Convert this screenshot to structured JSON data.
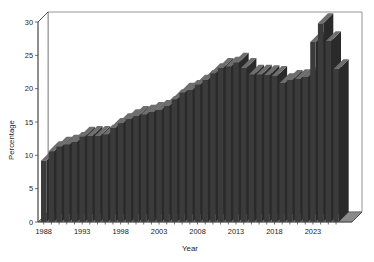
{
  "chart": {
    "title": "",
    "xlabel": "Year",
    "ylabel": "Percentage"
  },
  "axes": {
    "y_ticks": [
      "0",
      "5",
      "10",
      "15",
      "20",
      "25",
      "30"
    ],
    "x_ticks": [
      "1988",
      "1993",
      "1998",
      "2003",
      "2008",
      "2013",
      "2018",
      "2023"
    ]
  },
  "style": {
    "bar_front_color": "#3b3b3b",
    "bar_top_color": "#6e6e6e",
    "bar_side_color": "#2a2a2a",
    "axis_color": "#4a4a4a",
    "background_color": "#ffffff",
    "floor_color": "#6b6b6b"
  },
  "chart_data": {
    "type": "bar",
    "title": "",
    "xlabel": "Year",
    "ylabel": "Percentage",
    "ylim": [
      0,
      30
    ],
    "xlim": [
      1988,
      2024
    ],
    "grid": false,
    "legend": false,
    "three_d": true,
    "ytick_values": [
      0,
      5,
      10,
      15,
      20,
      25,
      30
    ],
    "xtick_values": [
      1988,
      1993,
      1998,
      2003,
      2008,
      2013,
      2018,
      2023
    ],
    "categories": [
      "1988",
      "1989",
      "1990",
      "1991",
      "1992",
      "1993",
      "1994",
      "1995",
      "1996",
      "1997",
      "1998",
      "1999",
      "2000",
      "2001",
      "2002",
      "2003",
      "2004",
      "2005",
      "2006",
      "2007",
      "2008",
      "2009",
      "2010",
      "2011",
      "2012",
      "2013",
      "2014",
      "2015",
      "2016",
      "2017",
      "2018",
      "2019",
      "2020",
      "2021",
      "2022",
      "2023",
      "2024"
    ],
    "values": [
      9.2,
      10.6,
      11.3,
      11.6,
      12.0,
      12.8,
      12.9,
      12.9,
      13.1,
      14.1,
      14.8,
      15.4,
      15.9,
      16.1,
      16.5,
      16.8,
      17.4,
      18.4,
      19.4,
      19.8,
      20.6,
      21.3,
      22.3,
      23.1,
      23.3,
      23.9,
      23.1,
      22.1,
      22.1,
      22.0,
      21.9,
      20.8,
      21.3,
      21.4,
      21.7,
      27.0,
      29.8
    ],
    "values_tail": [
      27.1,
      22.9
    ],
    "series": [
      {
        "name": "Percentage",
        "values": [
          9.2,
          10.6,
          11.3,
          11.6,
          12.0,
          12.8,
          12.9,
          12.9,
          13.1,
          14.1,
          14.8,
          15.4,
          15.9,
          16.1,
          16.5,
          16.8,
          17.4,
          18.4,
          19.4,
          19.8,
          20.6,
          21.3,
          22.3,
          23.1,
          23.3,
          23.9,
          23.1,
          22.1,
          22.1,
          22.0,
          21.9,
          20.8,
          21.3,
          21.4,
          21.7,
          27.0,
          29.8
        ]
      }
    ],
    "bars": [
      {
        "year": 1988,
        "value": 9.2
      },
      {
        "year": 1989,
        "value": 10.6
      },
      {
        "year": 1990,
        "value": 11.3
      },
      {
        "year": 1991,
        "value": 11.6
      },
      {
        "year": 1992,
        "value": 12.0
      },
      {
        "year": 1993,
        "value": 12.8
      },
      {
        "year": 1994,
        "value": 12.9
      },
      {
        "year": 1995,
        "value": 12.9
      },
      {
        "year": 1996,
        "value": 13.1
      },
      {
        "year": 1997,
        "value": 14.1
      },
      {
        "year": 1998,
        "value": 14.8
      },
      {
        "year": 1999,
        "value": 15.4
      },
      {
        "year": 2000,
        "value": 15.9
      },
      {
        "year": 2001,
        "value": 16.1
      },
      {
        "year": 2002,
        "value": 16.5
      },
      {
        "year": 2003,
        "value": 16.8
      },
      {
        "year": 2004,
        "value": 17.4
      },
      {
        "year": 2005,
        "value": 18.4
      },
      {
        "year": 2006,
        "value": 19.4
      },
      {
        "year": 2007,
        "value": 19.8
      },
      {
        "year": 2008,
        "value": 20.6
      },
      {
        "year": 2009,
        "value": 21.3
      },
      {
        "year": 2010,
        "value": 22.3
      },
      {
        "year": 2011,
        "value": 23.1
      },
      {
        "year": 2012,
        "value": 23.3
      },
      {
        "year": 2013,
        "value": 23.9
      },
      {
        "year": 2014,
        "value": 23.1
      },
      {
        "year": 2015,
        "value": 22.1
      },
      {
        "year": 2016,
        "value": 22.1
      },
      {
        "year": 2017,
        "value": 22.0
      },
      {
        "year": 2018,
        "value": 21.9
      },
      {
        "year": 2019,
        "value": 20.8
      },
      {
        "year": 2020,
        "value": 21.3
      },
      {
        "year": 2021,
        "value": 21.4
      },
      {
        "year": 2022,
        "value": 21.7
      },
      {
        "year": 2023,
        "value": 27.0
      },
      {
        "year": 2024,
        "value": 29.8
      },
      {
        "year": 2025,
        "value": 27.1
      },
      {
        "year": 2026,
        "value": 22.9
      }
    ]
  }
}
